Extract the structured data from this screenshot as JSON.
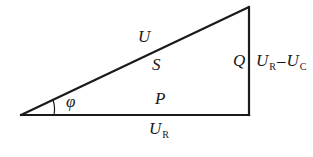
{
  "diagram": {
    "type": "power-triangle",
    "stroke_color": "#1a1a1a",
    "vertices": {
      "left": [
        21,
        115
      ],
      "top_right": [
        249,
        7
      ],
      "bottom_right": [
        249,
        115
      ]
    },
    "labels": {
      "hypotenuse_outer": "U",
      "hypotenuse_inner": "S",
      "base_inner": "P",
      "base_outer": {
        "main": "U",
        "sub": "R"
      },
      "vertical_inner": "Q",
      "vertical_outer": {
        "term1": {
          "main": "U",
          "sub": "R"
        },
        "operator": "–",
        "term2": {
          "main": "U",
          "sub": "C"
        }
      },
      "angle": "φ"
    }
  }
}
